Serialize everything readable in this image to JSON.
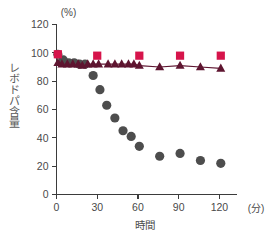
{
  "axes": {
    "y_unit_label": "(%)",
    "y_axis_title": "レボドパ含量",
    "x_axis_title": "時間",
    "x_unit_label": "(分)",
    "y_ticks": [
      "0",
      "20",
      "40",
      "60",
      "80",
      "100",
      "120"
    ],
    "x_ticks": [
      "0",
      "30",
      "60",
      "90",
      "120"
    ]
  },
  "colors": {
    "square_series": "#d6144b",
    "triangle_series": "#5e1530",
    "circle_series": "#4d4d4d",
    "axis": "#3b3b3b",
    "text": "#4a4a4a",
    "background": "#ffffff"
  },
  "chart_data": {
    "type": "scatter",
    "title": "",
    "xlabel": "時間",
    "ylabel": "レボドパ含量",
    "xunit": "(分)",
    "yunit": "(%)",
    "xlim": [
      0,
      130
    ],
    "ylim": [
      0,
      120
    ],
    "xticks": [
      0,
      30,
      60,
      90,
      120
    ],
    "yticks": [
      0,
      20,
      40,
      60,
      80,
      100,
      120
    ],
    "grid": false,
    "legend": "none",
    "series": [
      {
        "name": "square-series",
        "marker": "square",
        "color": "#d6144b",
        "points": [
          {
            "x": 1,
            "y": 99
          },
          {
            "x": 30,
            "y": 98
          },
          {
            "x": 61,
            "y": 98
          },
          {
            "x": 91,
            "y": 98
          },
          {
            "x": 121,
            "y": 98
          }
        ]
      },
      {
        "name": "triangle-series",
        "marker": "triangle",
        "color": "#5e1530",
        "points": [
          {
            "x": 1,
            "y": 93
          },
          {
            "x": 4,
            "y": 92
          },
          {
            "x": 8,
            "y": 92
          },
          {
            "x": 12,
            "y": 92
          },
          {
            "x": 16,
            "y": 92
          },
          {
            "x": 19,
            "y": 91
          },
          {
            "x": 23,
            "y": 92
          },
          {
            "x": 27,
            "y": 92
          },
          {
            "x": 31,
            "y": 92
          },
          {
            "x": 38,
            "y": 92
          },
          {
            "x": 43,
            "y": 92
          },
          {
            "x": 48,
            "y": 92
          },
          {
            "x": 53,
            "y": 92
          },
          {
            "x": 57,
            "y": 92
          },
          {
            "x": 61,
            "y": 91
          },
          {
            "x": 76,
            "y": 90
          },
          {
            "x": 91,
            "y": 91
          },
          {
            "x": 106,
            "y": 90
          },
          {
            "x": 121,
            "y": 89
          }
        ]
      },
      {
        "name": "circle-series",
        "marker": "circle",
        "color": "#4d4d4d",
        "points": [
          {
            "x": 1,
            "y": 99
          },
          {
            "x": 5,
            "y": 95
          },
          {
            "x": 9,
            "y": 93
          },
          {
            "x": 13,
            "y": 93
          },
          {
            "x": 17,
            "y": 92
          },
          {
            "x": 21,
            "y": 92
          },
          {
            "x": 27,
            "y": 84
          },
          {
            "x": 32,
            "y": 74
          },
          {
            "x": 37,
            "y": 63
          },
          {
            "x": 43,
            "y": 54
          },
          {
            "x": 49,
            "y": 45
          },
          {
            "x": 55,
            "y": 41
          },
          {
            "x": 61,
            "y": 34
          },
          {
            "x": 76,
            "y": 27
          },
          {
            "x": 91,
            "y": 29
          },
          {
            "x": 106,
            "y": 24
          },
          {
            "x": 121,
            "y": 22
          }
        ]
      }
    ]
  }
}
